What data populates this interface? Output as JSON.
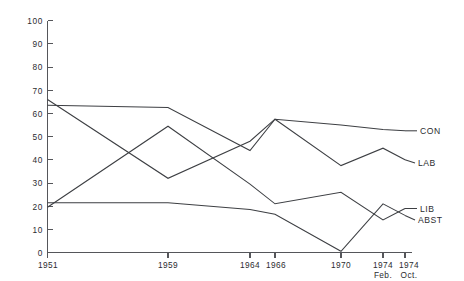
{
  "chart_data": {
    "type": "line",
    "title": "",
    "subtitle": "",
    "xlabel": "",
    "ylabel": "",
    "ylim": [
      0,
      100
    ],
    "grid": false,
    "legend_position": "right-inline",
    "categories": [
      "1951",
      "1959",
      "1964",
      "1966",
      "1970",
      "1974 Feb.",
      "1974 Oct."
    ],
    "x_tick_labels": [
      {
        "main": "1951",
        "sub": ""
      },
      {
        "main": "1959",
        "sub": ""
      },
      {
        "main": "1964",
        "sub": ""
      },
      {
        "main": "1966",
        "sub": ""
      },
      {
        "main": "1970",
        "sub": ""
      },
      {
        "main": "1974",
        "sub": "Feb."
      },
      {
        "main": "1974",
        "sub": "Oct."
      }
    ],
    "y_tick_labels": [
      "100",
      "90",
      "80",
      "70",
      "60",
      "50",
      "40",
      "30",
      "20",
      "10",
      "0"
    ],
    "y_ticks": [
      100,
      90,
      80,
      70,
      60,
      50,
      40,
      30,
      20,
      10,
      0
    ],
    "series": [
      {
        "name": "CON",
        "label": "CON",
        "values": [
          63.5,
          62.5,
          44.0,
          57.5,
          55.0,
          53.0,
          52.5
        ]
      },
      {
        "name": "LAB",
        "label": "LAB",
        "values": [
          66.0,
          32.0,
          48.0,
          57.5,
          37.5,
          45.0,
          40.0
        ]
      },
      {
        "name": "LIB",
        "label": "LIB",
        "values": [
          19.5,
          54.5,
          29.5,
          21.0,
          26.0,
          14.0,
          19.0
        ]
      },
      {
        "name": "ABST",
        "label": "ABST",
        "values": [
          21.5,
          21.5,
          18.5,
          16.5,
          0.5,
          21.0,
          16.0
        ]
      }
    ],
    "series_labels": [
      {
        "text": "CON",
        "at_value": 52.5
      },
      {
        "text": "LAB",
        "at_value": 40.0
      },
      {
        "text": "LIB",
        "at_value": 19.0
      },
      {
        "text": "ABST",
        "at_value": 16.0
      }
    ],
    "colors": {
      "line": "#3d3f43",
      "axis": "#55565a",
      "text": "#2b2c2f",
      "background": "#ffffff"
    }
  }
}
